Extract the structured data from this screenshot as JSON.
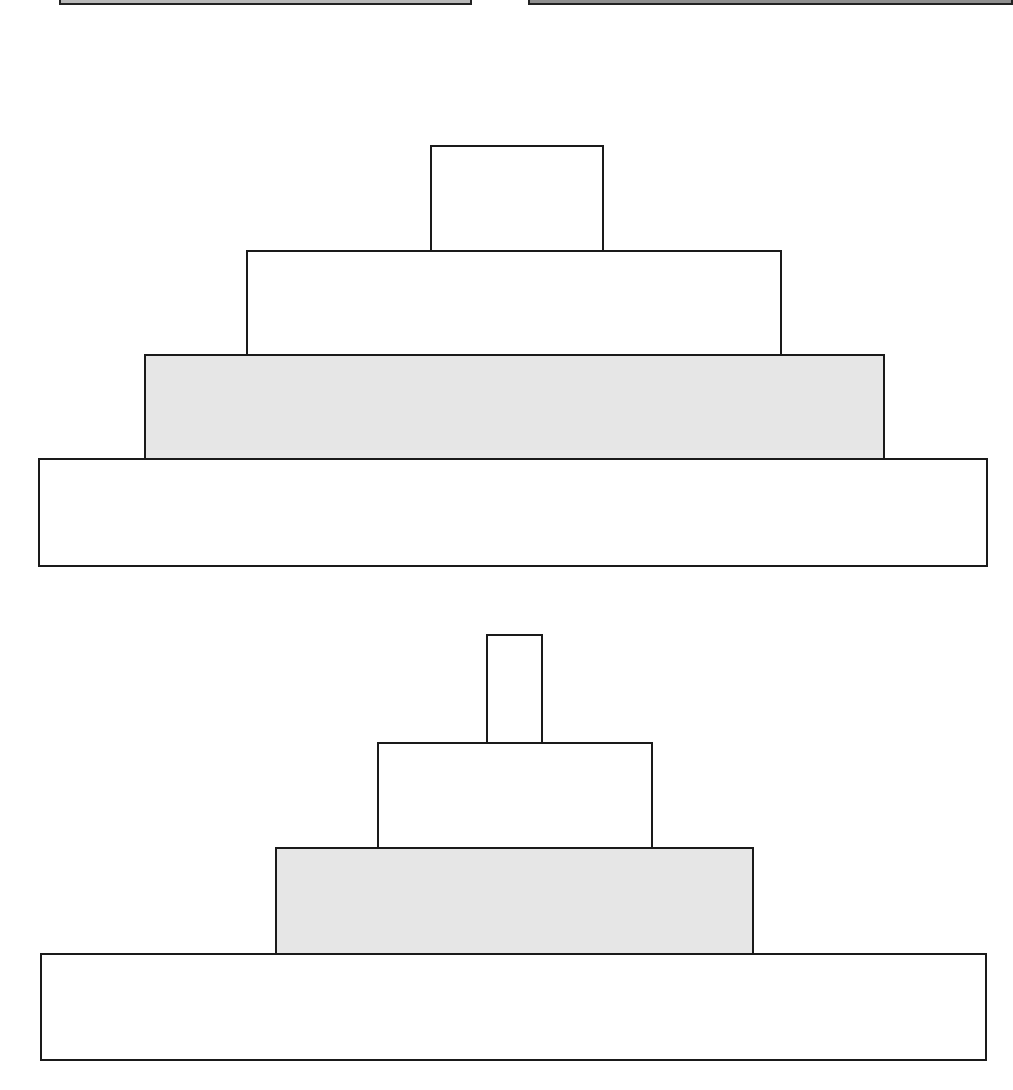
{
  "colors": {
    "stroke": "#1a1a1a",
    "white_fill": "#ffffff",
    "grey_fill": "#e6e6e6",
    "strip_fill": "#b8b8b8"
  },
  "top_strips": [
    {
      "x": 59,
      "w": 413,
      "fill": "#b8b8b8"
    },
    {
      "x": 528,
      "w": 485,
      "fill": "#8f8f8f"
    }
  ],
  "pyramids": [
    {
      "name": "upper-pyramid",
      "tiers": [
        {
          "x": 430,
          "y": 145,
          "w": 174,
          "h": 107,
          "fill": "#ffffff"
        },
        {
          "x": 246,
          "y": 250,
          "w": 536,
          "h": 106,
          "fill": "#ffffff"
        },
        {
          "x": 144,
          "y": 354,
          "w": 741,
          "h": 107,
          "fill": "#e6e6e6"
        },
        {
          "x": 38,
          "y": 458,
          "w": 950,
          "h": 109,
          "fill": "#ffffff"
        }
      ]
    },
    {
      "name": "lower-pyramid",
      "tiers": [
        {
          "x": 486,
          "y": 634,
          "w": 57,
          "h": 110,
          "fill": "#ffffff"
        },
        {
          "x": 377,
          "y": 742,
          "w": 276,
          "h": 107,
          "fill": "#ffffff"
        },
        {
          "x": 275,
          "y": 847,
          "w": 479,
          "h": 109,
          "fill": "#e6e6e6"
        },
        {
          "x": 40,
          "y": 953,
          "w": 947,
          "h": 108,
          "fill": "#ffffff"
        }
      ]
    }
  ]
}
